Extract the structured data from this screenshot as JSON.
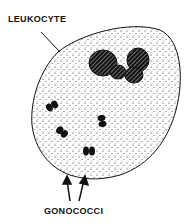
{
  "diagram": {
    "labels": {
      "top": "LEUKOCYTE",
      "bottom": "GONOCOCCI"
    },
    "colors": {
      "ink": "#111111",
      "background": "#ffffff"
    }
  }
}
